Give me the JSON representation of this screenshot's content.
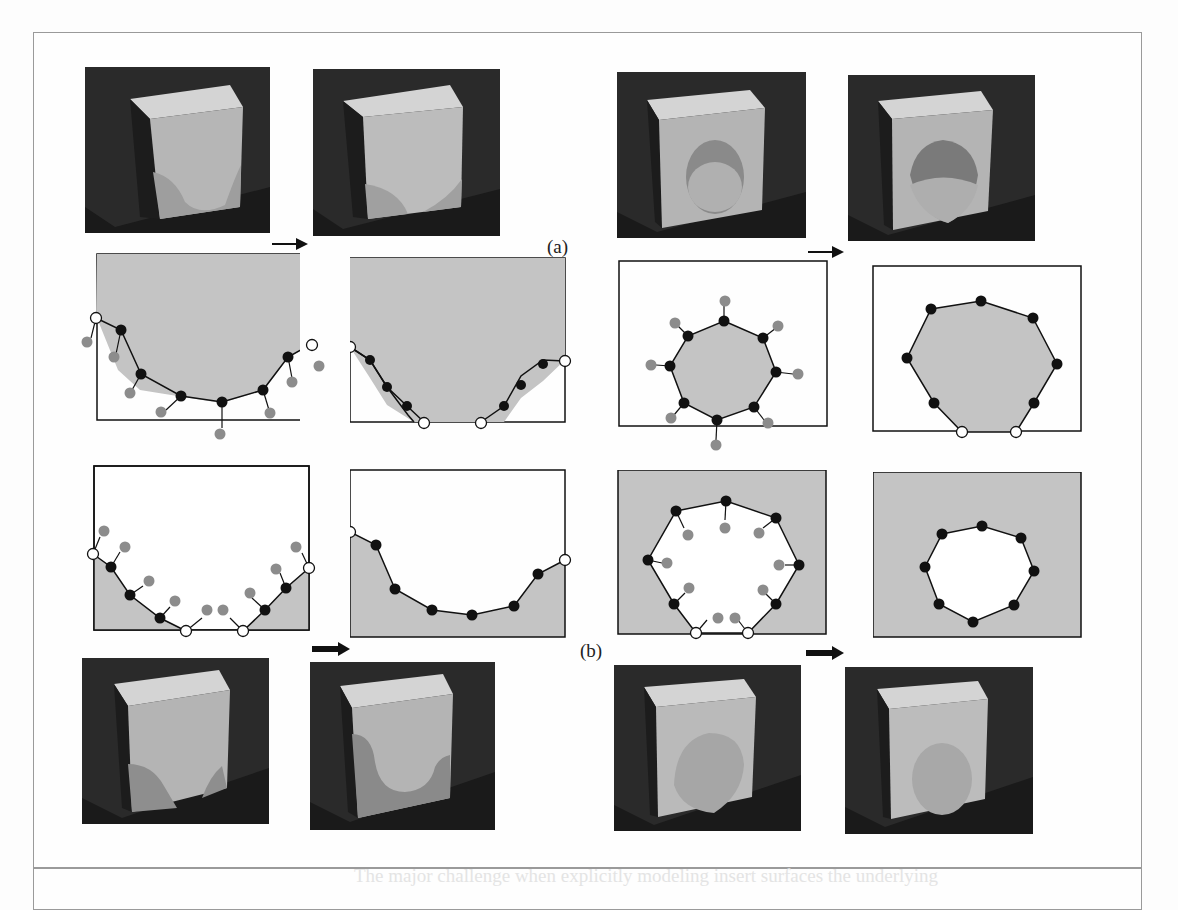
{
  "figure": {
    "row_labels": {
      "a": "(a)",
      "b": "(b)"
    },
    "ghost_text": [
      "ranged when the fluid in the immediate support become too",
      "generated by boundary, shown in black, while others at the",
      "section 2 we describe the deformation of the model and",
      "The major challenge when explicitly modeling insert surfaces the underlying"
    ],
    "colors": {
      "region_fill": "#c4c4c4",
      "boundary_stroke": "#111111",
      "vertex_moving": "#111111",
      "vertex_fixed": "#ffffff",
      "vertex_target": "#8c8c8c",
      "render_bg": "#2a2a2a",
      "block_face": "#b8b8b8",
      "block_top": "#d6d6d6"
    },
    "rows": [
      {
        "name": "row-a-renders",
        "panels": [
          "u-notch-start",
          "u-notch-melted",
          "round-hole-start",
          "round-hole-melted"
        ]
      },
      {
        "name": "row-a-diagrams",
        "panels": [
          "u-curve-with-targets",
          "u-curve-result",
          "octagon-with-targets",
          "octagon-result"
        ]
      },
      {
        "name": "row-b-diagrams",
        "panels": [
          "v-curve-with-targets",
          "v-curve-result",
          "heptagon-with-targets",
          "heptagon-result"
        ]
      },
      {
        "name": "row-b-renders",
        "panels": [
          "v-notch-start",
          "v-notch-grown",
          "round-plug-start",
          "round-plug-grown"
        ]
      }
    ]
  }
}
